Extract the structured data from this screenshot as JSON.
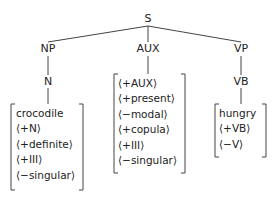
{
  "tree": {
    "root": "S",
    "branches": [
      {
        "label": "NP",
        "child": "N",
        "features": [
          "crocodile",
          "⟨+N⟩",
          "⟨+definite⟩",
          "⟨+III⟩",
          "⟨−singular⟩"
        ]
      },
      {
        "label": "AUX",
        "features": [
          "⟨+AUX⟩",
          "⟨+present⟩",
          "⟨−modal⟩",
          "⟨+copula⟩",
          "⟨+III⟩",
          "⟨−singular⟩"
        ]
      },
      {
        "label": "VP",
        "child": "VB",
        "features": [
          "hungry",
          "⟨+VB⟩",
          "⟨−V⟩"
        ]
      }
    ]
  },
  "colors": {
    "ink": "#222222",
    "background": "#ffffff"
  }
}
